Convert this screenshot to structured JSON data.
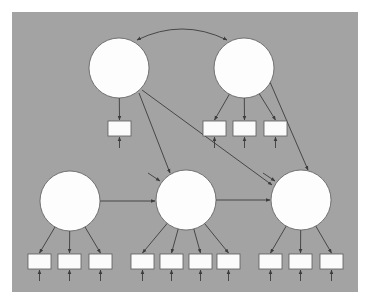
{
  "diagram": {
    "type": "structural-equation-model",
    "background_color": "#a3a3a3",
    "node_fill": "#fdfdfd",
    "line_color": "#3c3c3c",
    "panel": {
      "x": 12,
      "y": 12,
      "w": 346,
      "h": 280
    },
    "latent_radius": 30,
    "latents": [
      {
        "id": "L1",
        "cx": 119,
        "cy": 68
      },
      {
        "id": "L2",
        "cx": 244,
        "cy": 68
      },
      {
        "id": "L3",
        "cx": 70,
        "cy": 201
      },
      {
        "id": "L4",
        "cx": 186,
        "cy": 200
      },
      {
        "id": "L5",
        "cx": 301,
        "cy": 200
      }
    ],
    "indicator_size": {
      "w": 23,
      "h": 15
    },
    "indicators": [
      {
        "id": "y1",
        "latent": "L1",
        "x": 108,
        "y": 121
      },
      {
        "id": "y2",
        "latent": "L2",
        "x": 203,
        "y": 121
      },
      {
        "id": "y3",
        "latent": "L2",
        "x": 233,
        "y": 121
      },
      {
        "id": "y4",
        "latent": "L2",
        "x": 264,
        "y": 121
      },
      {
        "id": "y5",
        "latent": "L3",
        "x": 28,
        "y": 254
      },
      {
        "id": "y6",
        "latent": "L3",
        "x": 58,
        "y": 254
      },
      {
        "id": "y7",
        "latent": "L3",
        "x": 89,
        "y": 254
      },
      {
        "id": "y8",
        "latent": "L4",
        "x": 131,
        "y": 254
      },
      {
        "id": "y9",
        "latent": "L4",
        "x": 160,
        "y": 254
      },
      {
        "id": "y10",
        "latent": "L4",
        "x": 189,
        "y": 254
      },
      {
        "id": "y11",
        "latent": "L4",
        "x": 217,
        "y": 254
      },
      {
        "id": "y12",
        "latent": "L5",
        "x": 259,
        "y": 254
      },
      {
        "id": "y13",
        "latent": "L5",
        "x": 289,
        "y": 254
      },
      {
        "id": "y14",
        "latent": "L5",
        "x": 320,
        "y": 254
      }
    ],
    "structural_paths": [
      {
        "from": "L1",
        "to": "L4",
        "x1": 139,
        "y1": 93,
        "x2": 170,
        "y2": 173
      },
      {
        "from": "L1",
        "to": "L5",
        "x1": 142,
        "y1": 90,
        "x2": 272,
        "y2": 185
      },
      {
        "from": "L2",
        "to": "L5",
        "x1": 270,
        "y1": 82,
        "x2": 308,
        "y2": 170
      },
      {
        "from": "L3",
        "to": "L4",
        "x1": 100,
        "y1": 201,
        "x2": 155,
        "y2": 201
      },
      {
        "from": "L4",
        "to": "L5",
        "x1": 216,
        "y1": 200,
        "x2": 270,
        "y2": 200
      }
    ],
    "covariances": [
      {
        "between": [
          "L1",
          "L2"
        ],
        "path": "M137,40 Q182,18 227,40"
      }
    ],
    "disturbances": [
      {
        "latent": "L4",
        "x1": 148,
        "y1": 173,
        "x2": 160,
        "y2": 181
      },
      {
        "latent": "L5",
        "x1": 263,
        "y1": 173,
        "x2": 275,
        "y2": 181
      }
    ]
  }
}
